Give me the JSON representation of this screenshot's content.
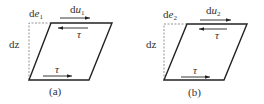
{
  "panels": [
    {
      "id": "a",
      "caption": "(a)",
      "top_label_d": "d",
      "top_label_var": "u",
      "top_label_sub": "1",
      "corner_label_d": "d",
      "corner_label_var": "e",
      "corner_label_sub": "1",
      "height_label": "dz",
      "shear_top": "τ",
      "shear_bottom": "τ"
    },
    {
      "id": "b",
      "caption": "(b)",
      "top_label_d": "d",
      "top_label_var": "u",
      "top_label_sub": "2",
      "corner_label_d": "d",
      "corner_label_var": "e",
      "corner_label_sub": "2",
      "height_label": "dz",
      "shear_top": "τ",
      "shear_bottom": "τ"
    }
  ],
  "colors": {
    "stroke": "#222222",
    "dashed": "#888888",
    "text": "#333333"
  }
}
